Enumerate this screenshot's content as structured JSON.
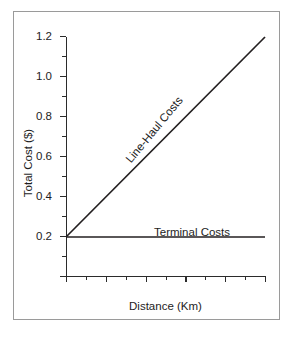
{
  "chart_data": {
    "type": "line",
    "title": "",
    "xlabel": "Distance (Km)",
    "ylabel": "Total Cost ($)",
    "xlim": [
      0,
      100
    ],
    "ylim": [
      0,
      1.2
    ],
    "grid": false,
    "legend_position": "inline-annotations",
    "x_ticks_major": [
      0,
      20,
      40,
      60,
      80,
      100
    ],
    "x_tick_labels": [
      "",
      "20",
      "40",
      "60",
      "80",
      "100"
    ],
    "x_ticks_minor": [
      10,
      30,
      50,
      70,
      90
    ],
    "y_ticks_major": [
      0.2,
      0.4,
      0.6,
      0.8,
      1.0,
      1.2
    ],
    "y_tick_labels": [
      "0.2",
      "0.4",
      "0.6",
      "0.8",
      "1.0",
      "1.2"
    ],
    "y_ticks_minor": [
      0.1,
      0.3,
      0.5,
      0.7,
      0.9,
      1.1
    ],
    "series": [
      {
        "name": "Line-Haul Costs",
        "x": [
          0,
          100
        ],
        "values": [
          0.2,
          1.2
        ]
      },
      {
        "name": "Terminal Costs",
        "x": [
          0,
          100
        ],
        "values": [
          0.2,
          0.2
        ]
      }
    ],
    "annotations": [
      {
        "text": "Line-Haul Costs",
        "series": "Line-Haul Costs"
      },
      {
        "text": "Terminal Costs",
        "series": "Terminal Costs"
      }
    ],
    "line_color": "#231f20",
    "frame_color": "#9a9a9a",
    "background": "#ffffff"
  }
}
